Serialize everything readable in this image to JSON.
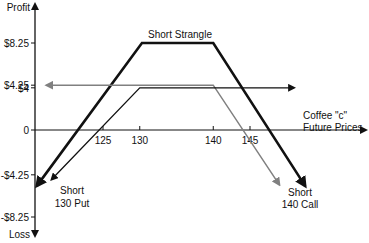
{
  "chart_data": {
    "type": "line",
    "title": "Short Strangle",
    "xlabel": "Coffee \"c\" Future Prices",
    "xlabel_lines": [
      "Coffee \"c\"",
      "Future Prices"
    ],
    "ylabel_top": "Profit",
    "ylabel_bottom": "Loss",
    "x_ticks": [
      125,
      130,
      140,
      145
    ],
    "x_tick_labels": [
      "125",
      "130",
      "140",
      "145"
    ],
    "y_ticks": [
      8.25,
      4.25,
      4,
      0,
      -4.25,
      -8.25
    ],
    "y_tick_labels": [
      "$8.25",
      "$4.25",
      "$4",
      "0",
      "-$4.25",
      "-$8.25"
    ],
    "xlim": [
      115,
      155
    ],
    "ylim": [
      -9.5,
      10
    ],
    "grid": false,
    "series": [
      {
        "name": "Short Strangle",
        "label": "Short Strangle",
        "color": "#111111",
        "points": [
          [
            116,
            -5.3
          ],
          [
            130.3,
            8.25
          ],
          [
            140,
            8.25
          ],
          [
            152.5,
            -5.3
          ]
        ]
      },
      {
        "name": "Short 140 Call",
        "label_lines": [
          "Short",
          "140 Call"
        ],
        "color": "#808080",
        "points": [
          [
            117.3,
            4.25
          ],
          [
            140,
            4.25
          ],
          [
            149,
            -5.2
          ]
        ]
      },
      {
        "name": "Short 130 Put",
        "label_lines": [
          "Short",
          "130 Put"
        ],
        "color": "#111111",
        "points": [
          [
            118,
            -4.7
          ],
          [
            130,
            4
          ],
          [
            151,
            4
          ]
        ]
      }
    ],
    "colors": {
      "axis": "#111111",
      "strangle": "#111111",
      "call": "#808080",
      "put": "#111111"
    }
  }
}
